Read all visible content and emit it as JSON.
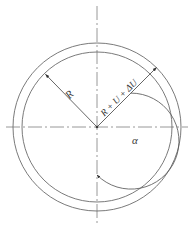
{
  "figure": {
    "background_color": "#ffffff",
    "line_color": "#6b6b6b",
    "text_color": "#3a3a3a",
    "axis_color": "#8c8c8c"
  },
  "geometry": {
    "center_x": 97,
    "center_y": 127,
    "inner_circle_radius": 75,
    "outer_circle_radius": 84,
    "angle_arc_radius": 48
  },
  "labels": {
    "inner_radius_label": "R",
    "outer_radius_label": "R + U + ΔU",
    "angle_label": "α"
  },
  "axes": {
    "vertical_axis_style": "dash-dot",
    "horizontal_axis_style": "dash-dot",
    "vertical_axis_label": "",
    "horizontal_axis_label": ""
  },
  "annotations": [
    {
      "name": "inner-radius-arrow",
      "from": "center",
      "to": "inner-circle",
      "direction_deg": 135,
      "label": "R"
    },
    {
      "name": "outer-radius-arrow",
      "from": "center",
      "to": "outer-circle",
      "direction_deg": 45,
      "label": "R + U + ΔU"
    },
    {
      "name": "angle-arc-arrow",
      "from": "outer-radius-direction",
      "to": "vertical-axis-down",
      "label": "α"
    }
  ]
}
